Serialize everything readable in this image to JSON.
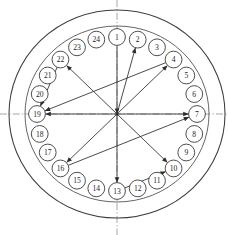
{
  "diagram": {
    "subtitle": "24-bolt circular flange pattern",
    "type": "bolt-sequence-star-pattern",
    "bolt_count": 24,
    "geometry": {
      "center_x": 117,
      "center_y": 114,
      "flange_rim_rx": 108,
      "flange_rim_ry": 104,
      "bolt_circle_rx": 92,
      "bolt_circle_ry": 88,
      "bolt_label_radius_x": 80,
      "bolt_label_radius_y": 77,
      "bolt_marker_radius": 8.4,
      "start_angle_deg": -90,
      "angle_step_deg": 15,
      "direction": "clockwise"
    },
    "centerlines": {
      "horizontal_y": 114,
      "vertical_x": 117,
      "style": "dash-dot",
      "color": "#8a8a8a",
      "horizontal_label": "horizontal-centerline",
      "vertical_label": "vertical-centerline"
    },
    "colors": {
      "rim_stroke": "#3d3d3d",
      "bolt_stroke": "#3a3a3a",
      "bolt_fill": "#ffffff",
      "label_text": "#1d1d1d",
      "vector_stroke": "#2c2c2c",
      "centerline": "#8a8a8a",
      "background": "#ffffff"
    },
    "bolts": [
      {
        "id": 1,
        "label": "1",
        "angle_deg": -90
      },
      {
        "id": 2,
        "label": "2",
        "angle_deg": -75
      },
      {
        "id": 3,
        "label": "3",
        "angle_deg": -60
      },
      {
        "id": 4,
        "label": "4",
        "angle_deg": -45
      },
      {
        "id": 5,
        "label": "5",
        "angle_deg": -30
      },
      {
        "id": 6,
        "label": "6",
        "angle_deg": -15
      },
      {
        "id": 7,
        "label": "7",
        "angle_deg": 0
      },
      {
        "id": 8,
        "label": "8",
        "angle_deg": 15
      },
      {
        "id": 9,
        "label": "9",
        "angle_deg": 30
      },
      {
        "id": 10,
        "label": "10",
        "angle_deg": 45
      },
      {
        "id": 11,
        "label": "11",
        "angle_deg": 60
      },
      {
        "id": 12,
        "label": "12",
        "angle_deg": 75
      },
      {
        "id": 13,
        "label": "13",
        "angle_deg": 90
      },
      {
        "id": 14,
        "label": "14",
        "angle_deg": 105
      },
      {
        "id": 15,
        "label": "15",
        "angle_deg": 120
      },
      {
        "id": 16,
        "label": "16",
        "angle_deg": 135
      },
      {
        "id": 17,
        "label": "17",
        "angle_deg": 150
      },
      {
        "id": 18,
        "label": "18",
        "angle_deg": 165
      },
      {
        "id": 19,
        "label": "19",
        "angle_deg": 180
      },
      {
        "id": 20,
        "label": "20",
        "angle_deg": 195
      },
      {
        "id": 21,
        "label": "21",
        "angle_deg": 210
      },
      {
        "id": 22,
        "label": "22",
        "angle_deg": 225
      },
      {
        "id": 23,
        "label": "23",
        "angle_deg": 240
      },
      {
        "id": 24,
        "label": "24",
        "angle_deg": 255
      }
    ],
    "sequence_vectors": [
      {
        "from_bolt": 1,
        "to_bolt": "center",
        "arrow_at": "center",
        "order": 1,
        "name": "vector-1-to-center"
      },
      {
        "from_bolt": "center",
        "to_bolt": 2,
        "arrow_at": "bolt",
        "order": 2,
        "name": "vector-center-to-2"
      },
      {
        "from_bolt": "center",
        "to_bolt": 4,
        "arrow_at": "bolt",
        "order": 3,
        "name": "vector-center-to-4"
      },
      {
        "from_bolt": "center",
        "to_bolt": 7,
        "arrow_at": "bolt",
        "order": 4,
        "name": "vector-center-to-7"
      },
      {
        "from_bolt": "center",
        "to_bolt": 10,
        "arrow_at": "bolt",
        "order": 5,
        "name": "vector-center-to-10"
      },
      {
        "from_bolt": "center",
        "to_bolt": 13,
        "arrow_at": "bolt",
        "order": 6,
        "name": "vector-center-to-13"
      },
      {
        "from_bolt": "center",
        "to_bolt": 16,
        "arrow_at": "bolt",
        "order": 7,
        "name": "vector-center-to-16"
      },
      {
        "from_bolt": "center",
        "to_bolt": 19,
        "arrow_at": "bolt",
        "order": 8,
        "name": "vector-center-to-19"
      },
      {
        "from_bolt": "center",
        "to_bolt": 22,
        "arrow_at": "bolt",
        "order": 9,
        "name": "vector-center-to-22"
      },
      {
        "from_bolt": 16,
        "to_bolt": 7,
        "arrow_at": "bolt",
        "order": 10,
        "name": "vector-16-to-7"
      },
      {
        "from_bolt": 4,
        "to_bolt": 19,
        "arrow_at": "bolt",
        "order": 11,
        "name": "vector-4-to-19"
      },
      {
        "from_bolt": 22,
        "to_bolt": 19,
        "arrow_at": "bolt",
        "order": 12,
        "name": "vector-22-to-19"
      },
      {
        "from_bolt": 13,
        "to_bolt": 10,
        "arrow_at": "bolt",
        "order": 13,
        "name": "vector-13-to-10"
      }
    ]
  }
}
